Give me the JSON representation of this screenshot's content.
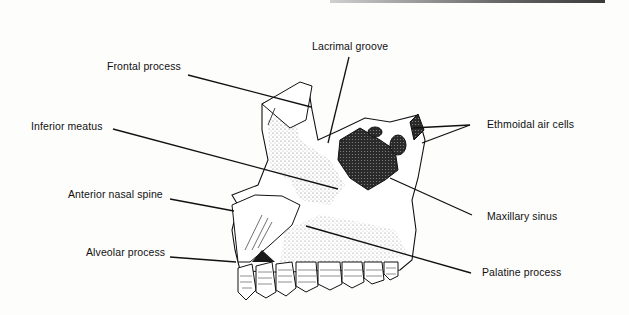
{
  "figure": {
    "labels": [
      {
        "id": "lacrimal-groove",
        "text": "Lacrimal groove",
        "x": 312,
        "y": 40
      },
      {
        "id": "frontal-process",
        "text": "Frontal process",
        "x": 107,
        "y": 60
      },
      {
        "id": "ethmoidal-air-cells",
        "text": "Ethmoidal air cells",
        "x": 487,
        "y": 118
      },
      {
        "id": "inferior-meatus",
        "text": "Inferior meatus",
        "x": 31,
        "y": 120
      },
      {
        "id": "anterior-nasal-spine",
        "text": "Anterior nasal spine",
        "x": 68,
        "y": 188
      },
      {
        "id": "maxillary-sinus",
        "text": "Maxillary sinus",
        "x": 487,
        "y": 210
      },
      {
        "id": "alveolar-process",
        "text": "Alveolar process",
        "x": 86,
        "y": 246
      },
      {
        "id": "palatine-process",
        "text": "Palatine process",
        "x": 482,
        "y": 266
      }
    ],
    "colors": {
      "ink": "#111111",
      "background": "#fdfdfc"
    }
  }
}
